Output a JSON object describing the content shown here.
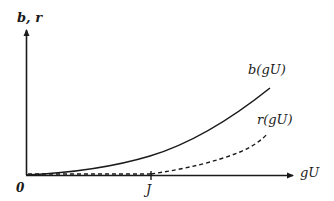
{
  "diagram": {
    "y_axis_label": "b, r",
    "x_axis_label": "gU",
    "origin_label": "0",
    "tick_label": "J",
    "curves": [
      {
        "name": "b(gU)",
        "label": "b(gU)",
        "style": "solid"
      },
      {
        "name": "r(gU)",
        "label": "r(gU)",
        "style": "dashed",
        "starts_at": "J"
      }
    ],
    "colors": {
      "ink": "#1a1a1a",
      "background": "#ffffff"
    }
  }
}
